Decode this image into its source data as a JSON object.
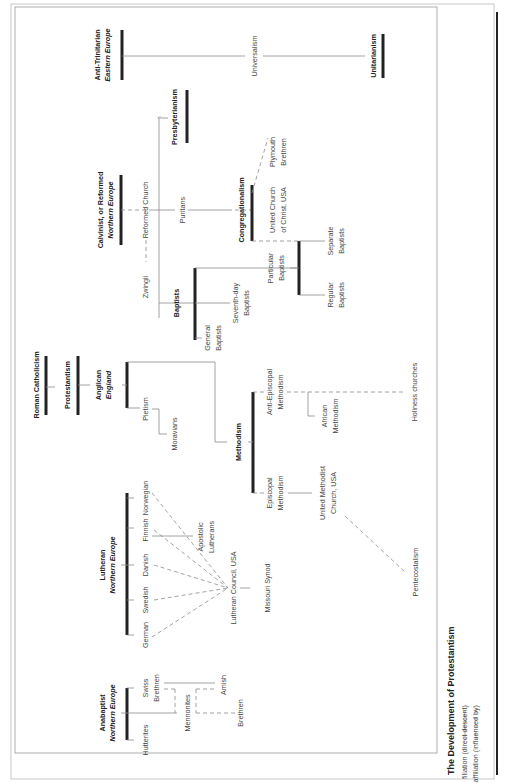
{
  "title": "The Development of Protestantism",
  "legend": {
    "filiation": "filiation (direct descent)",
    "affiliation": "affiliation (influenced by)"
  },
  "nodes": {
    "roman_catholicism": "Roman Catholicism",
    "protestantism": "Protestantism",
    "anglican": "Anglican",
    "anglican_region": "England",
    "anabaptist": "Anabaptist",
    "anabaptist_region": "Northern Europe",
    "lutheran": "Lutheran",
    "lutheran_region": "Northern Europe",
    "calvinist": "Calvinist, or Reformed",
    "calvinist_region": "Northern Europe",
    "anti_trinitarian": "Anti-Trinitarian",
    "anti_trinitarian_region": "Eastern Europe",
    "unitarianism": "Unitarianism",
    "universalism": "Universalism",
    "presbyterianism": "Presbyterianism",
    "reformed_church": "Reformed Church",
    "puritans": "Puritans",
    "zwingli": "Zwingli",
    "congregationalism": "Congregationalism",
    "plymouth": "Plymouth",
    "plymouth2": "Brethren",
    "ucc": "United Church",
    "ucc2": "of Christ, USA",
    "baptists": "Baptists",
    "general_baptists": "General",
    "general_baptists2": "Baptists",
    "seventh_day": "Seventh-day",
    "seventh_day2": "Baptists",
    "particular": "Particular",
    "particular2": "Baptists",
    "separate": "Separate",
    "separate2": "Baptists",
    "regular": "Regular",
    "regular2": "Baptists",
    "pietism": "Pietism",
    "moravians": "Moravians",
    "methodism": "Methodism",
    "anti_episcopal": "Anti-Episcopal",
    "anti_episcopal2": "Methodism",
    "african": "African",
    "african2": "Methodism",
    "holiness": "Holiness churches",
    "episcopal": "Episcopal",
    "episcopal2": "Methodism",
    "umc": "United Methodist",
    "umc2": "Church, USA",
    "pentecostalism": "Pentecostalism",
    "norwegian": "Norwegian",
    "finnish": "Finnish",
    "danish": "Danish",
    "swedish": "Swedish",
    "german": "German",
    "apostolic": "Apostolic",
    "apostolic2": "Lutherans",
    "lutheran_council": "Lutheran Council, USA",
    "missouri": "Missouri Synod",
    "swiss_brethren": "Swiss",
    "swiss_brethren2": "Brethren",
    "hutterites": "Hutterites",
    "mennonites": "Mennonites",
    "amish": "Amish",
    "brethren": "Brethren"
  }
}
